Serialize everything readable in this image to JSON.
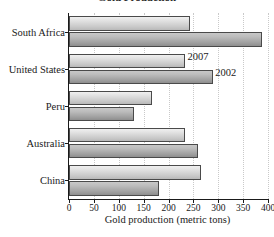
{
  "chart_data": {
    "type": "bar",
    "orientation": "horizontal",
    "title": "Gold Production",
    "xlabel": "Gold production (metric tons)",
    "ylabel": "",
    "xlim": [
      0,
      400
    ],
    "xticks": [
      0,
      50,
      100,
      150,
      200,
      250,
      300,
      350,
      400
    ],
    "xtick_labels": [
      "0",
      "50",
      "100",
      "150",
      "200",
      "250",
      "300",
      "350",
      "400"
    ],
    "grid": "vertical-dotted",
    "legend_position": "inline-callout",
    "categories": [
      "South Africa",
      "United States",
      "Peru",
      "Australia",
      "China"
    ],
    "series": [
      {
        "name": "2007",
        "color": "#dcdcdc",
        "values": [
          244,
          234,
          166,
          234,
          266
        ]
      },
      {
        "name": "2002",
        "color": "#a8a8a8",
        "values": [
          388,
          290,
          130,
          260,
          180
        ]
      }
    ],
    "callouts": [
      {
        "label": "2007",
        "series": "2007"
      },
      {
        "label": "2002",
        "series": "2002"
      }
    ]
  }
}
